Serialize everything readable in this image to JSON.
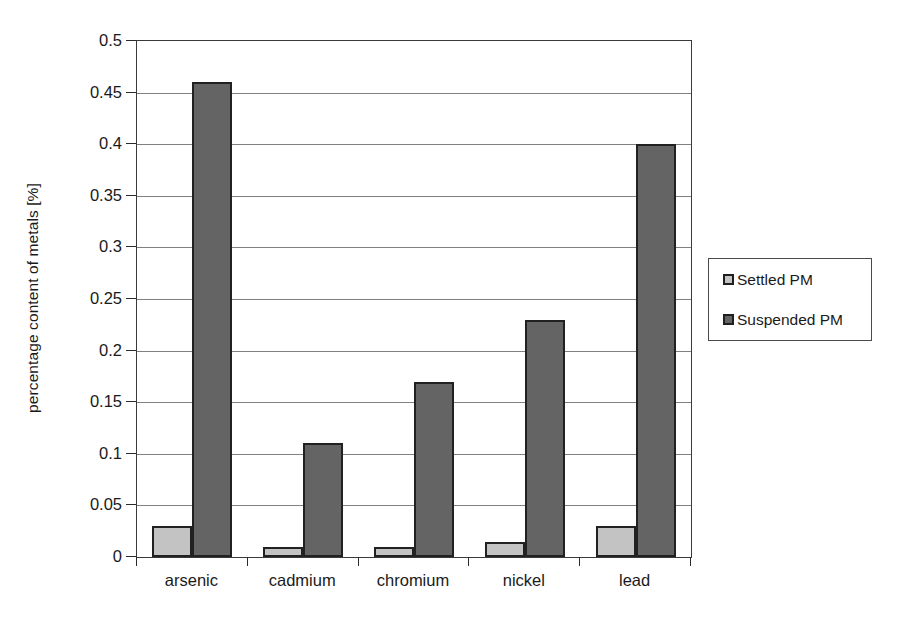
{
  "chart_data": {
    "type": "bar",
    "title": "",
    "xlabel": "",
    "ylabel": "percentage content of metals [%]",
    "categories": [
      "arsenic",
      "cadmium",
      "chromium",
      "nickel",
      "lead"
    ],
    "series": [
      {
        "name": "Settled PM",
        "values": [
          0.03,
          0.01,
          0.01,
          0.015,
          0.03
        ],
        "color": "#c3c3c3"
      },
      {
        "name": "Suspended PM",
        "values": [
          0.46,
          0.11,
          0.17,
          0.23,
          0.4
        ],
        "color": "#646464"
      }
    ],
    "ylim": [
      0,
      0.5
    ],
    "ytick_labels": [
      "0",
      "0.05",
      "0.1",
      "0.15",
      "0.2",
      "0.25",
      "0.3",
      "0.35",
      "0.4",
      "0.45",
      "0.5"
    ],
    "ytick_values": [
      0,
      0.05,
      0.1,
      0.15,
      0.2,
      0.25,
      0.3,
      0.35,
      0.4,
      0.45,
      0.5
    ],
    "grid": true,
    "grid_axis": "y",
    "grid_color": "#808080",
    "legend_position": "right",
    "legend_entries": [
      "Settled PM",
      "Suspended PM"
    ],
    "plot_border": true,
    "bar_edge_color": "#212121",
    "background_color": "#ffffff"
  }
}
